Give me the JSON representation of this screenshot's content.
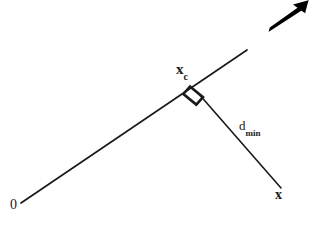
{
  "figure": {
    "background_color": "#ffffff",
    "stroke_color": "#1a1a1a",
    "width": 309,
    "height": 226,
    "labels": {
      "origin": "0",
      "closest_point_base": "x",
      "closest_point_sub": "c",
      "distance_base": "d",
      "distance_sub": "min",
      "point_x": "x"
    },
    "caption_remnant": "",
    "elements": {
      "ray_name": "principal-ray-line",
      "perpendicular_name": "perpendicular-distance-line",
      "right_angle_name": "right-angle-marker",
      "arrow_name": "direction-arrow"
    }
  },
  "geometry": {
    "ray": {
      "x1": 21,
      "y1": 203,
      "x2": 247,
      "y2": 50
    },
    "perpendicular": {
      "x1": 198,
      "y1": 93,
      "x2": 281,
      "y2": 188
    },
    "right_angle_marker": {
      "cx": 196,
      "cy": 92,
      "size": 13
    },
    "arrow": {
      "x1": 269,
      "y1": 31,
      "x2": 306,
      "y2": 3
    }
  }
}
